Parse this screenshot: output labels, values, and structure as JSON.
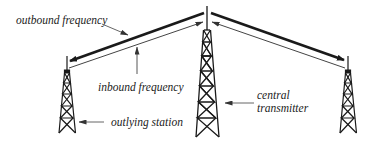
{
  "diagram": {
    "type": "radio-network-schematic",
    "labels": {
      "outbound": "outbound frequency",
      "inbound": "inbound frequency",
      "outlying": "outlying station",
      "central_line1": "central",
      "central_line2": "transmitter"
    },
    "nodes": [
      {
        "id": "central-transmitter",
        "role": "central transmitter"
      },
      {
        "id": "outlying-station-left",
        "role": "outlying station"
      },
      {
        "id": "outlying-station-right",
        "role": "outlying station"
      }
    ],
    "links": [
      {
        "from": "central-transmitter",
        "to": "outlying-station-left",
        "kind": "outbound frequency",
        "weight": "thick"
      },
      {
        "from": "central-transmitter",
        "to": "outlying-station-right",
        "kind": "outbound frequency",
        "weight": "thick"
      },
      {
        "from": "outlying-station-left",
        "to": "central-transmitter",
        "kind": "inbound frequency",
        "weight": "thin"
      },
      {
        "from": "outlying-station-right",
        "to": "central-transmitter",
        "kind": "inbound frequency",
        "weight": "thin"
      }
    ],
    "colors": {
      "ink": "#1a1a1a",
      "thin_line": "#555555",
      "background": "#ffffff"
    }
  }
}
